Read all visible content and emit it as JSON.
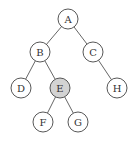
{
  "diagram": {
    "type": "binary-tree",
    "highlight_color": "#d3d3d3",
    "node_fill": "#ffffff",
    "nodes": [
      {
        "id": "A",
        "label": "A",
        "x": 68,
        "y": 19,
        "highlighted": false
      },
      {
        "id": "B",
        "label": "B",
        "x": 40,
        "y": 52,
        "highlighted": false
      },
      {
        "id": "C",
        "label": "C",
        "x": 93,
        "y": 52,
        "highlighted": false
      },
      {
        "id": "D",
        "label": "D",
        "x": 21,
        "y": 88,
        "highlighted": false
      },
      {
        "id": "E",
        "label": "E",
        "x": 60,
        "y": 88,
        "highlighted": true
      },
      {
        "id": "H",
        "label": "H",
        "x": 117,
        "y": 88,
        "highlighted": false
      },
      {
        "id": "F",
        "label": "F",
        "x": 43,
        "y": 122,
        "highlighted": false
      },
      {
        "id": "G",
        "label": "G",
        "x": 78,
        "y": 122,
        "highlighted": false
      }
    ],
    "edges": [
      [
        "A",
        "B"
      ],
      [
        "A",
        "C"
      ],
      [
        "B",
        "D"
      ],
      [
        "B",
        "E"
      ],
      [
        "C",
        "H"
      ],
      [
        "E",
        "F"
      ],
      [
        "E",
        "G"
      ]
    ]
  }
}
